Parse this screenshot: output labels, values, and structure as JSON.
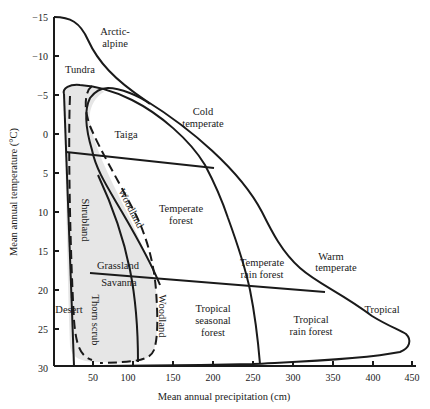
{
  "diagram": {
    "type": "biome-classification",
    "x_axis": {
      "title": "Mean annual precipitation (cm)",
      "ticks": [
        "50",
        "100",
        "150",
        "200",
        "250",
        "300",
        "350",
        "400",
        "450"
      ]
    },
    "y_axis": {
      "title": "Mean annual temperature (°C)",
      "ticks": [
        "−15",
        "−10",
        "−5",
        "0",
        "5",
        "10",
        "15",
        "20",
        "25",
        "30"
      ]
    },
    "climate_zones": {
      "arctic_alpine": [
        "Arctic-",
        "alpine"
      ],
      "cold_temperate": [
        "Cold",
        "temperate"
      ],
      "warm_temperate": [
        "Warm",
        "temperate"
      ],
      "tropical": "Tropical"
    },
    "biomes": {
      "tundra": "Tundra",
      "taiga": "Taiga",
      "temperate_forest": [
        "Temperate",
        "forest"
      ],
      "temperate_rain_forest": [
        "Temperate",
        "rain forest"
      ],
      "tropical_seasonal_forest": [
        "Tropical",
        "seasonal",
        "forest"
      ],
      "tropical_rain_forest": [
        "Tropical",
        "rain forest"
      ],
      "grassland": "Grassland",
      "savanna": "Savanna",
      "desert": "Desert",
      "shrubland": "Shrubland",
      "thorn_scrub": "Thorn scrub",
      "woodland_upper": "Woodland",
      "woodland_lower": "Woodland"
    },
    "colors": {
      "ink": "#1a1a1a",
      "shade": "#e6e6e6",
      "background": "#ffffff"
    }
  }
}
